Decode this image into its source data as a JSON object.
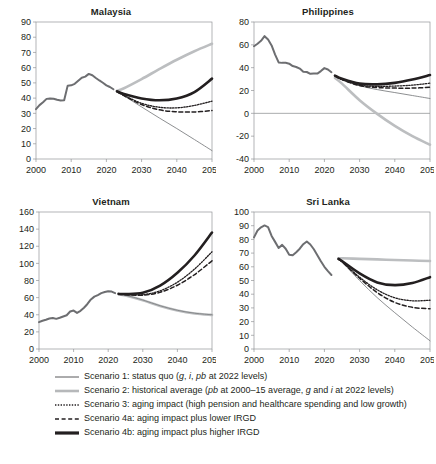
{
  "figure": {
    "background": "#ffffff",
    "text_color": "#231f20"
  },
  "panels": [
    {
      "key": "malaysia",
      "title": "Malaysia"
    },
    {
      "key": "philippines",
      "title": "Philippines"
    },
    {
      "key": "vietnam",
      "title": "Vietnam"
    },
    {
      "key": "srilanka",
      "title": "Sri Lanka"
    }
  ],
  "legend": {
    "items": [
      {
        "name": "scenario-1",
        "style": "thin-solid-dark",
        "color": "#58595b",
        "text_html": "Scenario 1: status quo (<i>g</i>, <i>i</i>, <i>pb</i> at 2022 levels)",
        "text": "Scenario 1: status quo (g, i, pb at 2022 levels)"
      },
      {
        "name": "scenario-2",
        "style": "thick-solid-light",
        "color": "#b6b8ba",
        "text_html": "Scenario 2: historical average (<i>pb</i> at 2000–15 average, <i>g</i> and <i>i</i> at 2022 levels)",
        "text": "Scenario 2: historical average (pb at 2000–15 average, g and i at 2022 levels)"
      },
      {
        "name": "scenario-3",
        "style": "dotted",
        "color": "#231f20",
        "text_html": "Scenario 3: aging impact (high pension and healthcare spending and low growth)",
        "text": "Scenario 3: aging impact (high pension and healthcare spending and low growth)"
      },
      {
        "name": "scenario-4a",
        "style": "dashed",
        "color": "#231f20",
        "text_html": "Scenario 4a: aging impact plus lower IRGD",
        "text": "Scenario 4a: aging impact plus lower IRGD"
      },
      {
        "name": "scenario-4b",
        "style": "thick-solid-dark",
        "color": "#231f20",
        "text_html": "Scenario 4b: aging impact plus higher IRGD",
        "text": "Scenario 4b: aging impact plus higher IRGD"
      }
    ]
  },
  "chart_data": [
    {
      "type": "line",
      "panel": "malaysia",
      "title": "Malaysia",
      "xlabel": "",
      "ylabel": "",
      "xlim": [
        2000,
        2050
      ],
      "ylim": [
        0,
        90
      ],
      "xticks": [
        2000,
        2010,
        2020,
        2030,
        2040,
        2050
      ],
      "yticks": [
        0,
        10,
        20,
        30,
        40,
        50,
        60,
        70,
        80,
        90
      ],
      "grid": false,
      "zero_line": false,
      "legend_position": "below-figure",
      "history": {
        "name": "historical",
        "x": [
          2000,
          2001,
          2002,
          2003,
          2004,
          2005,
          2006,
          2007,
          2008,
          2009,
          2010,
          2011,
          2012,
          2013,
          2014,
          2015,
          2016,
          2017,
          2018,
          2019,
          2020,
          2021,
          2022
        ],
        "y": [
          32.7,
          35.4,
          37.3,
          39.5,
          39.8,
          39.6,
          38.9,
          38.4,
          38.6,
          48.2,
          48.4,
          49.4,
          51.4,
          53.4,
          54.1,
          55.9,
          55.0,
          53.2,
          51.6,
          50.1,
          48.4,
          47.3,
          45.8
        ]
      },
      "series": [
        {
          "name": "Scenario 1",
          "x": [
            2023,
            2025,
            2030,
            2035,
            2040,
            2045,
            2050
          ],
          "y": [
            44.3,
            41.5,
            34.2,
            27.0,
            20.0,
            12.8,
            5.5
          ]
        },
        {
          "name": "Scenario 2",
          "x": [
            2023,
            2025,
            2030,
            2035,
            2040,
            2045,
            2050
          ],
          "y": [
            44.8,
            46.5,
            52.5,
            59.0,
            65.2,
            70.8,
            75.7
          ]
        },
        {
          "name": "Scenario 3",
          "x": [
            2023,
            2025,
            2030,
            2035,
            2040,
            2045,
            2050
          ],
          "y": [
            44.3,
            41.8,
            36.6,
            34.0,
            33.6,
            35.2,
            38.0
          ]
        },
        {
          "name": "Scenario 4a",
          "x": [
            2023,
            2025,
            2030,
            2035,
            2040,
            2045,
            2050
          ],
          "y": [
            44.3,
            41.6,
            35.8,
            32.3,
            31.0,
            30.9,
            31.8
          ]
        },
        {
          "name": "Scenario 4b",
          "x": [
            2023,
            2025,
            2030,
            2035,
            2040,
            2045,
            2050
          ],
          "y": [
            44.5,
            42.7,
            39.8,
            38.6,
            39.8,
            44.0,
            52.8
          ]
        }
      ]
    },
    {
      "type": "line",
      "panel": "philippines",
      "title": "Philippines",
      "xlabel": "",
      "ylabel": "",
      "xlim": [
        2000,
        2050
      ],
      "ylim": [
        -40,
        80
      ],
      "xticks": [
        2000,
        2010,
        2020,
        2030,
        2040,
        2050
      ],
      "yticks": [
        -40,
        -20,
        0,
        20,
        40,
        60,
        80
      ],
      "grid": false,
      "zero_line": true,
      "legend_position": "below-figure",
      "history": {
        "name": "historical",
        "x": [
          2000,
          2001,
          2002,
          2003,
          2004,
          2005,
          2006,
          2007,
          2008,
          2009,
          2010,
          2011,
          2012,
          2013,
          2014,
          2015,
          2016,
          2017,
          2018,
          2019,
          2020,
          2021,
          2022
        ],
        "y": [
          58.8,
          61.0,
          63.5,
          67.6,
          64.6,
          59.5,
          51.5,
          44.6,
          44.2,
          44.3,
          43.5,
          41.4,
          40.6,
          39.2,
          36.4,
          36.2,
          34.6,
          34.9,
          34.8,
          37.0,
          39.6,
          38.4,
          36.0
        ]
      },
      "series": [
        {
          "name": "Scenario 1",
          "x": [
            2023,
            2025,
            2030,
            2035,
            2040,
            2045,
            2050
          ],
          "y": [
            32.6,
            29.6,
            24.2,
            20.8,
            18.2,
            15.6,
            13.0
          ]
        },
        {
          "name": "Scenario 2",
          "x": [
            2023,
            2025,
            2030,
            2035,
            2040,
            2045,
            2050
          ],
          "y": [
            31.0,
            26.0,
            11.5,
            -0.5,
            -11.0,
            -20.0,
            -27.5
          ]
        },
        {
          "name": "Scenario 3",
          "x": [
            2023,
            2025,
            2030,
            2035,
            2040,
            2045,
            2050
          ],
          "y": [
            32.8,
            29.6,
            24.8,
            23.6,
            23.9,
            24.7,
            26.4
          ]
        },
        {
          "name": "Scenario 4a",
          "x": [
            2023,
            2025,
            2030,
            2035,
            2040,
            2045,
            2050
          ],
          "y": [
            32.8,
            29.5,
            24.3,
            22.6,
            22.1,
            22.1,
            22.8
          ]
        },
        {
          "name": "Scenario 4b",
          "x": [
            2023,
            2025,
            2030,
            2035,
            2040,
            2045,
            2050
          ],
          "y": [
            33.0,
            30.2,
            26.0,
            25.4,
            26.7,
            29.6,
            33.6
          ]
        }
      ]
    },
    {
      "type": "line",
      "panel": "vietnam",
      "title": "Vietnam",
      "xlabel": "",
      "ylabel": "",
      "xlim": [
        2000,
        2050
      ],
      "ylim": [
        0,
        160
      ],
      "xticks": [
        2000,
        2010,
        2020,
        2030,
        2040,
        2050
      ],
      "yticks": [
        0,
        20,
        40,
        60,
        80,
        100,
        120,
        140,
        160
      ],
      "grid": false,
      "zero_line": false,
      "legend_position": "below-figure",
      "history": {
        "name": "historical",
        "x": [
          2000,
          2001,
          2002,
          2003,
          2004,
          2005,
          2006,
          2007,
          2008,
          2009,
          2010,
          2011,
          2012,
          2013,
          2014,
          2015,
          2016,
          2017,
          2018,
          2019,
          2020,
          2021,
          2022
        ],
        "y": [
          31.4,
          33.0,
          34.2,
          35.6,
          36.3,
          35.2,
          36.5,
          38.0,
          39.4,
          43.8,
          44.9,
          42.2,
          44.6,
          48.2,
          52.6,
          57.9,
          61.2,
          63.0,
          65.2,
          66.5,
          67.4,
          67.1,
          65.3
        ]
      },
      "series": [
        {
          "name": "Scenario 1",
          "x": [
            2023,
            2025,
            2030,
            2035,
            2040,
            2045,
            2050
          ],
          "y": [
            64.0,
            62.8,
            57.2,
            50.5,
            45.2,
            41.8,
            40.0
          ]
        },
        {
          "name": "Scenario 2",
          "x": [
            2023,
            2025,
            2030,
            2035,
            2040,
            2045,
            2050
          ],
          "y": [
            64.0,
            62.6,
            57.0,
            50.2,
            45.0,
            41.5,
            39.8
          ]
        },
        {
          "name": "Scenario 3",
          "x": [
            2023,
            2025,
            2030,
            2035,
            2040,
            2045,
            2050
          ],
          "y": [
            64.2,
            63.6,
            63.4,
            68.0,
            78.0,
            93.5,
            113.5
          ]
        },
        {
          "name": "Scenario 4a",
          "x": [
            2023,
            2025,
            2030,
            2035,
            2040,
            2045,
            2050
          ],
          "y": [
            64.2,
            63.4,
            62.8,
            66.2,
            74.5,
            87.0,
            103.0
          ]
        },
        {
          "name": "Scenario 4b",
          "x": [
            2023,
            2025,
            2030,
            2035,
            2040,
            2045,
            2050
          ],
          "y": [
            64.4,
            64.2,
            65.6,
            74.0,
            89.0,
            109.5,
            136.0
          ]
        }
      ]
    },
    {
      "type": "line",
      "panel": "srilanka",
      "title": "Sri Lanka",
      "xlabel": "",
      "ylabel": "",
      "xlim": [
        2000,
        2050
      ],
      "ylim": [
        0,
        100
      ],
      "xticks": [
        2000,
        2010,
        2020,
        2030,
        2040,
        2050
      ],
      "yticks": [
        0,
        10,
        20,
        30,
        40,
        50,
        60,
        70,
        80,
        90,
        100
      ],
      "grid": false,
      "zero_line": false,
      "legend_position": "below-figure",
      "history": {
        "name": "historical",
        "x": [
          2000,
          2001,
          2002,
          2003,
          2004,
          2005,
          2006,
          2007,
          2008,
          2009,
          2010,
          2011,
          2012,
          2013,
          2014,
          2015,
          2016,
          2017,
          2018,
          2019,
          2020,
          2021,
          2022
        ],
        "y": [
          81.5,
          86.5,
          88.8,
          90.2,
          89.0,
          82.5,
          78.2,
          73.8,
          76.0,
          73.2,
          68.8,
          68.4,
          70.6,
          73.2,
          76.5,
          78.5,
          76.3,
          72.8,
          68.5,
          64.0,
          60.0,
          56.8,
          54.0
        ]
      },
      "series": [
        {
          "name": "Scenario 1",
          "x": [
            2024,
            2025,
            2030,
            2035,
            2040,
            2045,
            2050
          ],
          "y": [
            65.5,
            63.5,
            50.0,
            37.5,
            26.5,
            16.0,
            6.0
          ]
        },
        {
          "name": "Scenario 2",
          "x": [
            2024,
            2025,
            2030,
            2035,
            2040,
            2045,
            2050
          ],
          "y": [
            66.2,
            66.2,
            65.8,
            65.4,
            65.0,
            64.6,
            64.2
          ]
        },
        {
          "name": "Scenario 3",
          "x": [
            2024,
            2025,
            2030,
            2035,
            2040,
            2045,
            2050
          ],
          "y": [
            65.5,
            63.8,
            52.4,
            43.2,
            37.4,
            35.2,
            35.6
          ]
        },
        {
          "name": "Scenario 4a",
          "x": [
            2024,
            2025,
            2030,
            2035,
            2040,
            2045,
            2050
          ],
          "y": [
            65.5,
            63.6,
            51.6,
            41.2,
            34.0,
            30.4,
            29.4
          ]
        },
        {
          "name": "Scenario 4b",
          "x": [
            2024,
            2025,
            2030,
            2035,
            2040,
            2045,
            2050
          ],
          "y": [
            65.8,
            64.2,
            55.2,
            48.6,
            46.6,
            48.2,
            52.4
          ]
        }
      ]
    }
  ]
}
